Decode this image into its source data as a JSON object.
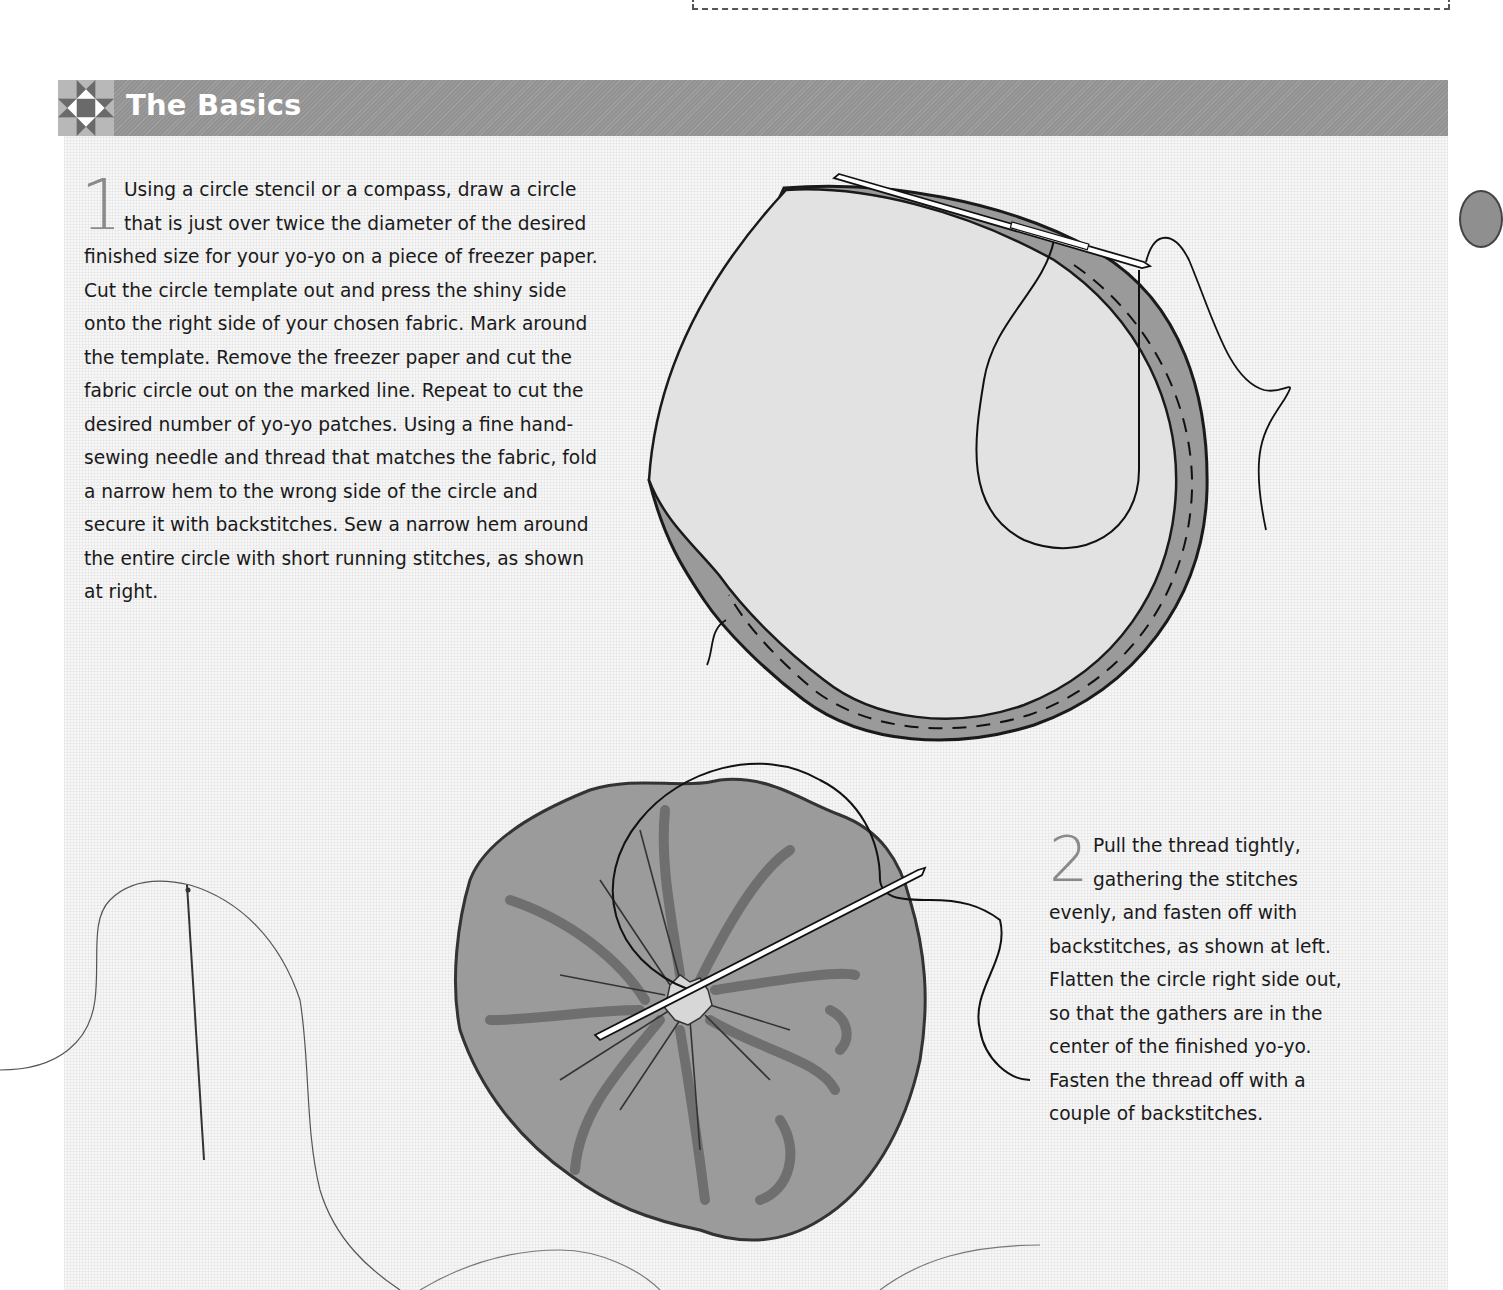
{
  "section": {
    "title": "The Basics",
    "icon": "ohio-star-quilt-block-icon"
  },
  "steps": [
    {
      "number": "1",
      "text": "Using a circle stencil or a compass, draw a circle that is just over twice the diameter of the desired finished size for your yo-yo on a piece of freezer paper. Cut the circle template out and press the shiny side onto the right side of your chosen fabric. Mark around the template. Remove the freezer paper and cut the fabric circle out on the marked line. Repeat to cut the desired number of yo-yo patches. Using a fine hand-sewing needle and thread that matches the fabric, fold a narrow hem to the wrong side of the circle and secure it with backstitches. Sew a narrow hem around the entire circle with short running stitches, as shown at right."
    },
    {
      "number": "2",
      "text": "Pull the thread tightly, gathering the stitches evenly, and fasten off with backstitches, as shown at left. Flatten the circle right side out, so that the gathers are in the center of the finished yo-yo. Fasten the thread off with a couple of backstitches."
    }
  ],
  "illustrations": [
    {
      "name": "fabric-circle-running-stitch",
      "description": "Fabric circle with hemmed edge, running stitches and needle"
    },
    {
      "name": "gathered-yoyo",
      "description": "Gathered yo-yo with needle through center"
    },
    {
      "name": "needle-and-thread",
      "description": "Loose needle and thread"
    }
  ],
  "colors": {
    "header_bar": "#929292",
    "header_text": "#ffffff",
    "panel_bg": "#f6f6f6",
    "fabric_light": "#e0e0e0",
    "fabric_hem": "#9a9a9a",
    "yoyo_fill": "#9b9b9b",
    "step_number": "#8a8a8a"
  }
}
